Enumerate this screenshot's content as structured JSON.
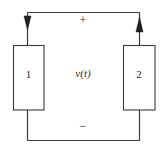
{
  "figure": {
    "type": "circuit-diagram",
    "background_color": "#ffffff",
    "line_color": "#3a3a3a",
    "text_color": "#2b2b2b",
    "elements": {
      "box1_label": "1",
      "box2_label": "2",
      "voltage_label": "v(t)",
      "plus_sign": "+",
      "minus_sign": "−"
    },
    "arrows": {
      "left_lead_direction": "down",
      "right_lead_direction": "up"
    }
  }
}
